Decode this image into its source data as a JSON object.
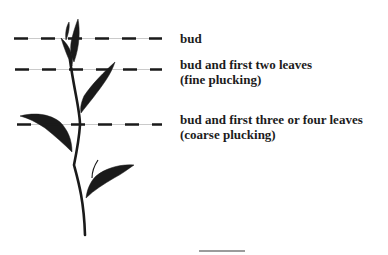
{
  "diagram": {
    "colors": {
      "plant": "#1a1a1a",
      "dash": "#1a1a1a",
      "guide_line": "#bdbdbd",
      "text": "#1c1c1c",
      "background": "#ffffff"
    },
    "levels": [
      {
        "id": "bud",
        "line_y": 38,
        "label_line1": "bud",
        "label_line2": ""
      },
      {
        "id": "fine",
        "line_y": 68,
        "label_line1": "bud and first two leaves",
        "label_line2": "(fine plucking)"
      },
      {
        "id": "coarse",
        "line_y": 124,
        "label_line1": "bud and first three or four leaves",
        "label_line2": "(coarse plucking)"
      }
    ],
    "footer_rule": {
      "x1": 199,
      "x2": 245,
      "y": 251
    }
  }
}
